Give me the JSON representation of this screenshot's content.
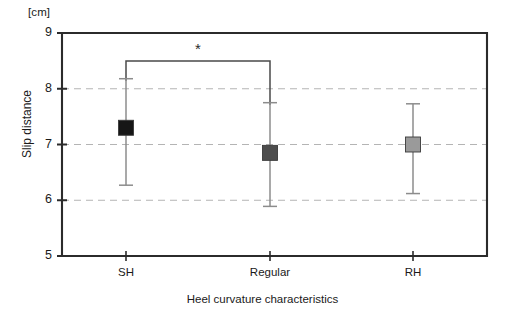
{
  "chart_data": {
    "type": "scatter",
    "title": "",
    "unit_label": "[cm]",
    "ylabel": "Slip distance",
    "xlabel": "Heel curvature characteristics",
    "categories": [
      "SH",
      "Regular",
      "RH"
    ],
    "values": [
      7.3,
      6.85,
      7.0
    ],
    "err_low": [
      6.27,
      5.89,
      6.12
    ],
    "err_high": [
      8.18,
      7.75,
      7.73
    ],
    "ylim": [
      5,
      9
    ],
    "yticks": [
      9,
      8,
      7,
      6,
      5
    ],
    "ytick_labels": [
      "9",
      "8",
      "7",
      "6",
      "5"
    ],
    "grid": "horizontal-dashed",
    "gridlines": [
      8,
      7,
      6
    ],
    "legend": "none",
    "marker": "square",
    "marker_colors": [
      "#161616",
      "#4d4d4d",
      "#9a9a9a"
    ],
    "annotations": [
      {
        "type": "significance-bracket",
        "label": "*",
        "from": "SH",
        "to": "Regular",
        "y": 8.5
      }
    ]
  },
  "colors": {
    "axis": "#2b2b2b",
    "grid": "#b4b4b4",
    "errorbar": "#8c8c8c",
    "marker_dark": "#161616",
    "marker_mid": "#4d4d4d",
    "marker_light": "#9a9a9a",
    "bracket": "#4a4a4a",
    "background": "#ffffff"
  }
}
